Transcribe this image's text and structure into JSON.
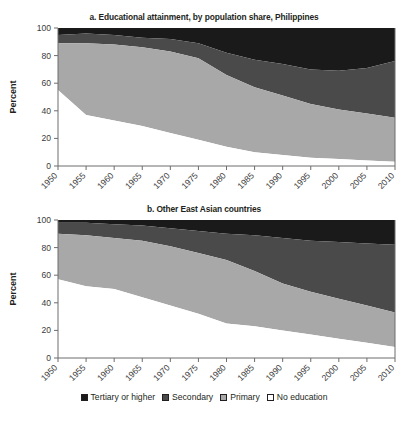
{
  "chart_data": [
    {
      "type": "area",
      "title": "a. Educational attainment, by population share, Philippines",
      "xlabel": "",
      "ylabel": "Percent",
      "ylim": [
        0,
        100
      ],
      "yticks": [
        0,
        20,
        40,
        60,
        80,
        100
      ],
      "grid": false,
      "stacked": true,
      "legend_position": "bottom",
      "x": [
        1950,
        1955,
        1960,
        1965,
        1970,
        1975,
        1980,
        1985,
        1990,
        1995,
        2000,
        2005,
        2010
      ],
      "categories": [
        "1950",
        "1955",
        "1960",
        "1965",
        "1970",
        "1975",
        "1980",
        "1985",
        "1990",
        "1995",
        "2000",
        "2005",
        "2010"
      ],
      "series": [
        {
          "name": "No education",
          "color": "#ffffff",
          "values": [
            55,
            37,
            33,
            29,
            24,
            19,
            14,
            10,
            8,
            6,
            5,
            4,
            3
          ]
        },
        {
          "name": "Primary",
          "color": "#a8a8a8",
          "values": [
            34,
            52,
            55,
            57,
            59,
            59,
            52,
            47,
            43,
            39,
            36,
            34,
            32
          ]
        },
        {
          "name": "Secondary",
          "color": "#4a4a4a",
          "values": [
            6,
            7,
            7,
            7,
            9,
            11,
            16,
            20,
            23,
            25,
            28,
            33,
            41
          ]
        },
        {
          "name": "Tertiary or higher",
          "color": "#1a1a1a",
          "values": [
            5,
            4,
            5,
            7,
            8,
            11,
            18,
            23,
            26,
            30,
            31,
            29,
            24
          ]
        }
      ],
      "cumulative_tops": {
        "no_education": [
          55,
          37,
          33,
          29,
          24,
          19,
          14,
          10,
          8,
          6,
          5,
          4,
          3
        ],
        "primary": [
          89,
          89,
          88,
          86,
          83,
          78,
          66,
          57,
          51,
          45,
          41,
          38,
          35
        ],
        "secondary": [
          95,
          96,
          95,
          93,
          92,
          89,
          82,
          77,
          74,
          70,
          69,
          71,
          76
        ],
        "tertiary": [
          100,
          100,
          100,
          100,
          100,
          100,
          100,
          100,
          100,
          100,
          100,
          100,
          100
        ]
      }
    },
    {
      "type": "area",
      "title": "b. Other East Asian countries",
      "xlabel": "",
      "ylabel": "Percent",
      "ylim": [
        0,
        100
      ],
      "yticks": [
        0,
        20,
        40,
        60,
        80,
        100
      ],
      "grid": false,
      "stacked": true,
      "legend_position": "bottom",
      "x": [
        1950,
        1955,
        1960,
        1965,
        1970,
        1975,
        1980,
        1985,
        1990,
        1995,
        2000,
        2005,
        2010
      ],
      "categories": [
        "1950",
        "1955",
        "1960",
        "1965",
        "1970",
        "1975",
        "1980",
        "1985",
        "1990",
        "1995",
        "2000",
        "2005",
        "2010"
      ],
      "series": [
        {
          "name": "No education",
          "color": "#ffffff",
          "values": [
            57,
            52,
            50,
            44,
            38,
            32,
            25,
            23,
            20,
            17,
            14,
            11,
            8
          ]
        },
        {
          "name": "Primary",
          "color": "#a8a8a8",
          "values": [
            33,
            37,
            37,
            41,
            43,
            44,
            46,
            40,
            34,
            31,
            29,
            27,
            25
          ]
        },
        {
          "name": "Secondary",
          "color": "#4a4a4a",
          "values": [
            8,
            9,
            10,
            11,
            13,
            16,
            19,
            26,
            33,
            37,
            41,
            45,
            49
          ]
        },
        {
          "name": "Tertiary or higher",
          "color": "#1a1a1a",
          "values": [
            2,
            2,
            3,
            4,
            6,
            8,
            10,
            11,
            13,
            15,
            16,
            17,
            18
          ]
        }
      ],
      "cumulative_tops": {
        "no_education": [
          57,
          52,
          50,
          44,
          38,
          32,
          25,
          23,
          20,
          17,
          14,
          11,
          8
        ],
        "primary": [
          90,
          89,
          87,
          85,
          81,
          76,
          71,
          63,
          54,
          48,
          43,
          38,
          33
        ],
        "secondary": [
          98,
          98,
          97,
          96,
          94,
          92,
          90,
          89,
          87,
          85,
          84,
          83,
          82
        ],
        "tertiary": [
          100,
          100,
          100,
          100,
          100,
          100,
          100,
          100,
          100,
          100,
          100,
          100,
          100
        ]
      }
    }
  ],
  "legend": {
    "items": [
      {
        "label": "Tertiary or higher",
        "color": "#1a1a1a"
      },
      {
        "label": "Secondary",
        "color": "#4a4a4a"
      },
      {
        "label": "Primary",
        "color": "#a8a8a8"
      },
      {
        "label": "No education",
        "color": "#ffffff"
      }
    ]
  }
}
